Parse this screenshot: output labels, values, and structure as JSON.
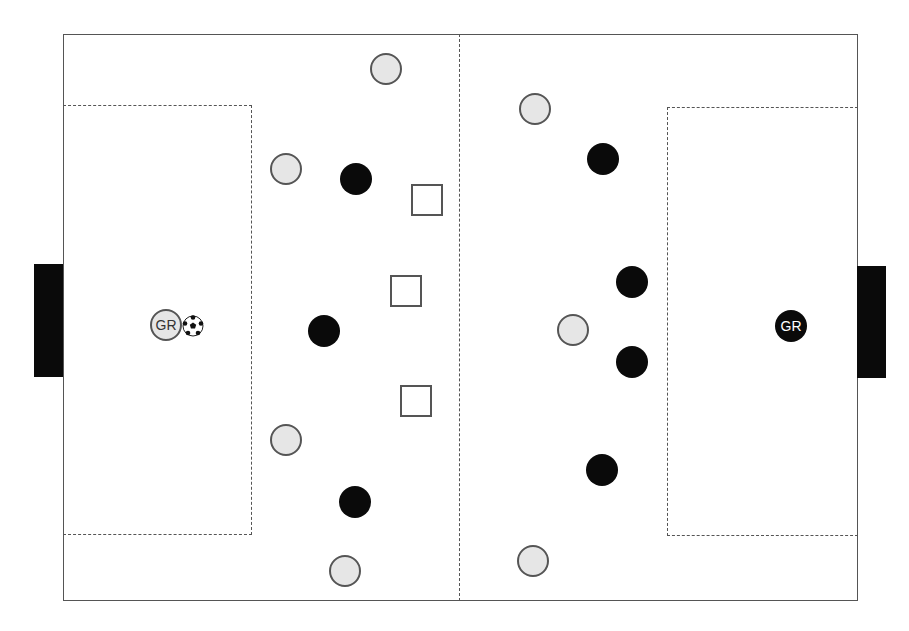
{
  "diagram": {
    "title": "",
    "pitch": {
      "field": {
        "x": 63,
        "y": 34,
        "w": 795,
        "h": 567
      },
      "midline_x": 459,
      "penalty_left": {
        "x": 63,
        "y": 105,
        "w": 189,
        "h": 430
      },
      "penalty_right": {
        "x": 667,
        "y": 107,
        "w": 191,
        "h": 429
      },
      "goal_left": {
        "x": 34,
        "y": 264,
        "w": 29,
        "h": 113
      },
      "goal_right": {
        "x": 857,
        "y": 266,
        "w": 29,
        "h": 112
      }
    },
    "goalkeepers": {
      "light": {
        "label": "GR",
        "x": 166,
        "y": 325
      },
      "dark": {
        "label": "GR",
        "x": 791,
        "y": 326
      }
    },
    "ball": {
      "x": 193,
      "y": 326
    },
    "light_players": [
      {
        "x": 386,
        "y": 69
      },
      {
        "x": 286,
        "y": 169
      },
      {
        "x": 286,
        "y": 440
      },
      {
        "x": 345,
        "y": 571
      },
      {
        "x": 535,
        "y": 109
      },
      {
        "x": 573,
        "y": 330
      },
      {
        "x": 533,
        "y": 561
      }
    ],
    "dark_players": [
      {
        "x": 356,
        "y": 179
      },
      {
        "x": 324,
        "y": 331
      },
      {
        "x": 355,
        "y": 502
      },
      {
        "x": 603,
        "y": 159
      },
      {
        "x": 632,
        "y": 282
      },
      {
        "x": 632,
        "y": 362
      },
      {
        "x": 602,
        "y": 470
      }
    ],
    "cones": [
      {
        "x": 411,
        "y": 184
      },
      {
        "x": 390,
        "y": 275
      },
      {
        "x": 400,
        "y": 385
      }
    ],
    "colors": {
      "light_team": "#e6e6e6",
      "dark_team": "#0a0a0a",
      "lines": "#555555"
    }
  }
}
